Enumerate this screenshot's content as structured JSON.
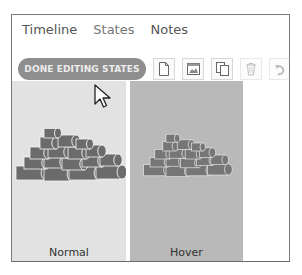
{
  "tabs": [
    {
      "label": "Timeline",
      "active": true
    },
    {
      "label": "States",
      "active": false
    },
    {
      "label": "Notes",
      "active": true
    }
  ],
  "toolbar": {
    "done_button_label": "DONE EDITING STATES",
    "icons": [
      "new-state-icon",
      "image-state-icon",
      "duplicate-state-icon",
      "delete-state-icon",
      "undo-icon"
    ]
  },
  "states": [
    {
      "label": "Normal",
      "background": "#e2e2e2"
    },
    {
      "label": "Hover",
      "background": "#b9b9b9"
    }
  ],
  "colors": {
    "pill_bg": "#8e8e8e",
    "pill_text": "#ececec",
    "log_fill": "#6b6b6b",
    "log_stroke": "#f4f4f4"
  }
}
